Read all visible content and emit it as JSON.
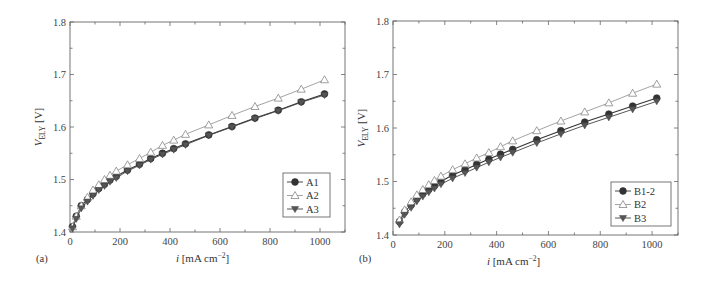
{
  "chart_data": [
    {
      "type": "line",
      "panel": "(a)",
      "xlabel": "i [mA cm⁻²]",
      "ylabel": "V_ELY [V]",
      "xlim": [
        0,
        1100
      ],
      "ylim": [
        1.4,
        1.8
      ],
      "xticks": [
        0,
        200,
        400,
        600,
        800,
        1000
      ],
      "yticks": [
        1.4,
        1.5,
        1.6,
        1.7,
        1.8
      ],
      "grid": false,
      "legend_position": "lower right",
      "x": [
        10,
        25,
        45,
        70,
        92,
        115,
        138,
        160,
        185,
        230,
        278,
        323,
        370,
        415,
        462,
        555,
        648,
        740,
        833,
        925,
        1018
      ],
      "series": [
        {
          "name": "A1",
          "marker": "filled-circle",
          "values": [
            1.41,
            1.43,
            1.45,
            1.462,
            1.473,
            1.483,
            1.491,
            1.499,
            1.506,
            1.518,
            1.529,
            1.54,
            1.55,
            1.559,
            1.568,
            1.585,
            1.601,
            1.617,
            1.632,
            1.648,
            1.663
          ]
        },
        {
          "name": "A2",
          "marker": "open-triangle-up",
          "values": [
            1.41,
            1.43,
            1.45,
            1.466,
            1.48,
            1.49,
            1.5,
            1.508,
            1.516,
            1.528,
            1.54,
            1.552,
            1.565,
            1.575,
            1.586,
            1.604,
            1.622,
            1.639,
            1.655,
            1.672,
            1.69
          ]
        },
        {
          "name": "A3",
          "marker": "filled-triangle-down",
          "values": [
            1.407,
            1.425,
            1.445,
            1.458,
            1.469,
            1.48,
            1.488,
            1.496,
            1.503,
            1.516,
            1.527,
            1.538,
            1.548,
            1.557,
            1.566,
            1.584,
            1.6,
            1.616,
            1.631,
            1.647,
            1.661
          ]
        }
      ]
    },
    {
      "type": "line",
      "panel": "(b)",
      "xlabel": "i [mA cm⁻²]",
      "ylabel": "V_ELY [V]",
      "xlim": [
        0,
        1100
      ],
      "ylim": [
        1.4,
        1.8
      ],
      "xticks": [
        0,
        200,
        400,
        600,
        800,
        1000
      ],
      "yticks": [
        1.4,
        1.5,
        1.6,
        1.7,
        1.8
      ],
      "grid": false,
      "legend_position": "lower right",
      "x": [
        25,
        45,
        70,
        92,
        115,
        138,
        160,
        185,
        230,
        278,
        323,
        370,
        415,
        462,
        555,
        648,
        740,
        833,
        925,
        1018
      ],
      "series": [
        {
          "name": "B1-2",
          "marker": "filled-circle",
          "values": [
            1.425,
            1.443,
            1.456,
            1.468,
            1.477,
            1.485,
            1.492,
            1.5,
            1.512,
            1.522,
            1.532,
            1.542,
            1.551,
            1.56,
            1.578,
            1.595,
            1.611,
            1.626,
            1.641,
            1.656
          ]
        },
        {
          "name": "B2",
          "marker": "open-triangle-up",
          "values": [
            1.428,
            1.447,
            1.462,
            1.475,
            1.485,
            1.494,
            1.502,
            1.51,
            1.522,
            1.533,
            1.544,
            1.554,
            1.565,
            1.576,
            1.595,
            1.613,
            1.63,
            1.647,
            1.665,
            1.682
          ]
        },
        {
          "name": "B3",
          "marker": "filled-triangle-down",
          "values": [
            1.42,
            1.438,
            1.451,
            1.463,
            1.472,
            1.48,
            1.487,
            1.495,
            1.506,
            1.516,
            1.526,
            1.536,
            1.545,
            1.554,
            1.572,
            1.589,
            1.605,
            1.62,
            1.635,
            1.65
          ]
        }
      ]
    }
  ],
  "labels": {
    "panel_a": "(a)",
    "panel_b": "(b)",
    "ylabel_main": "V",
    "ylabel_sub": "ELY",
    "ylabel_unit": " [V]",
    "xlabel_i": "i",
    "xlabel_unit": " [mA cm",
    "xlabel_exp": "−2",
    "xlabel_close": "]"
  }
}
